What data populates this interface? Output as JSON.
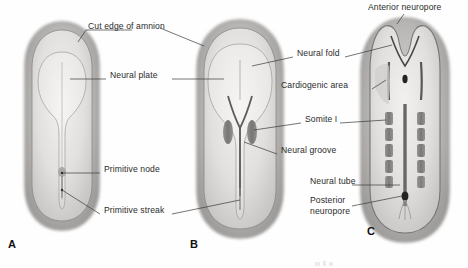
{
  "figure": {
    "background_color": "#fefefe",
    "label_color": "#2b2b2b",
    "leader_color": "#3a3a3a",
    "embryo_outline_color": "#6f6f6f",
    "amnion_fill": "#b4b4b4",
    "disc_fill": "#e6e4e2",
    "somite_fill": "#7d7b79",
    "neuropore_fill": "#2a2a2a"
  },
  "panels": [
    {
      "letter": "A",
      "name": "panel-a-neural-plate-stage",
      "labels": [
        "Cut edge of amnion",
        "Neural plate",
        "Primitive node",
        "Primitive streak"
      ]
    },
    {
      "letter": "B",
      "name": "panel-b-neural-groove-stage",
      "labels": [
        "Neural fold",
        "Neural groove",
        "Somite I",
        "Primitive streak",
        "Cut edge of amnion",
        "Neural plate"
      ]
    },
    {
      "letter": "C",
      "name": "panel-c-neural-tube-stage",
      "labels": [
        "Anterior neuropore",
        "Neural fold",
        "Cardiogenic area",
        "Somite I",
        "Neural tube",
        "Posterior neuropore"
      ]
    }
  ],
  "annotations": [
    {
      "id": "cut-edge-of-amnion",
      "text": "Cut edge of amnion",
      "x": 88,
      "y": 26
    },
    {
      "id": "neural-plate",
      "text": "Neural plate",
      "x": 110,
      "y": 75
    },
    {
      "id": "primitive-node",
      "text": "Primitive node",
      "x": 104,
      "y": 169
    },
    {
      "id": "primitive-streak",
      "text": "Primitive streak",
      "x": 104,
      "y": 210
    },
    {
      "id": "neural-fold",
      "text": "Neural fold",
      "x": 297,
      "y": 53
    },
    {
      "id": "cardiogenic-area",
      "text": "Cardiogenic area",
      "x": 281,
      "y": 85
    },
    {
      "id": "somite-i",
      "text": "Somite I",
      "x": 305,
      "y": 119
    },
    {
      "id": "neural-groove",
      "text": "Neural groove",
      "x": 281,
      "y": 150
    },
    {
      "id": "anterior-neuropore",
      "text": "Anterior neuropore",
      "x": 368,
      "y": 4
    },
    {
      "id": "neural-tube",
      "text": "Neural tube",
      "x": 310,
      "y": 181
    },
    {
      "id": "posterior-neuropore-line1",
      "text": "Posterior",
      "x": 310,
      "y": 200
    },
    {
      "id": "posterior-neuropore-line2",
      "text": "neuropore",
      "x": 310,
      "y": 210
    }
  ],
  "panel_letters": [
    {
      "id": "panel-letter-a",
      "text": "A",
      "x": 8,
      "y": 240
    },
    {
      "id": "panel-letter-b",
      "text": "B",
      "x": 190,
      "y": 240
    },
    {
      "id": "panel-letter-c",
      "text": "C",
      "x": 367,
      "y": 227
    }
  ],
  "caption": {
    "text": "",
    "x": 300,
    "y": 258
  }
}
